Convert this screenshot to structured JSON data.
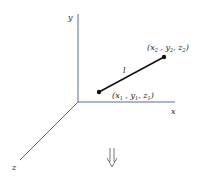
{
  "axes": {
    "x_label": "x",
    "y_label": "y",
    "z_label": "z",
    "color": "#5a64b4"
  },
  "segment": {
    "label": "l",
    "color": "#111111",
    "point1": {
      "x": "x",
      "y": "y",
      "z": "z",
      "sub": "1"
    },
    "point2": {
      "x": "x",
      "y": "y",
      "z": "z",
      "sub": "2"
    }
  },
  "arrow": {
    "direction": "down",
    "style": "double"
  }
}
